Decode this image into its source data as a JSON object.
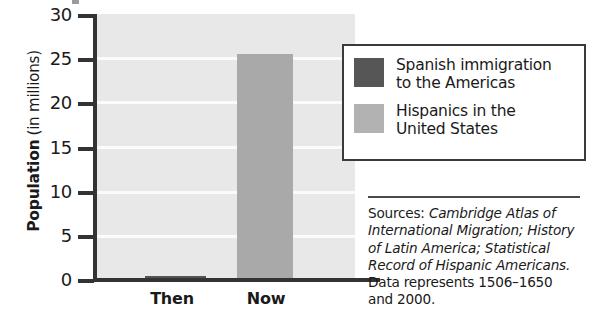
{
  "chart_data": {
    "type": "bar",
    "title": "",
    "xlabel": "",
    "ylabel": "Population (in millions)",
    "ylabel_bold_part": "Population",
    "ylabel_rest": "(in millions)",
    "categories": [
      "Then",
      "Now"
    ],
    "values": [
      0.6,
      25.5
    ],
    "series": [
      {
        "name": "Spanish immigration to the Americas",
        "values": [
          0.6,
          null
        ],
        "color": "#545454"
      },
      {
        "name": "Hispanics in the United States",
        "values": [
          null,
          25.5
        ],
        "color": "#a9a9a9"
      }
    ],
    "ylim": [
      0,
      30
    ],
    "yticks": [
      0,
      5,
      10,
      15,
      20,
      25,
      30
    ],
    "ytick_labels": [
      "0",
      "5",
      "10",
      "15",
      "20",
      "25",
      "30"
    ],
    "grid": true,
    "grid_color": "#fbfbfb",
    "plot_background": "#e8e8e8",
    "legend_position": "right",
    "legend": [
      {
        "label": "Spanish immigration\nto the Americas",
        "color": "#565656"
      },
      {
        "label": "Hispanics in the\nUnited States",
        "color": "#b2b2b2"
      }
    ],
    "annotations": {
      "sources_label": "Sources:",
      "sources_titles": [
        "Cambridge Atlas of",
        "International Migration; History",
        "of Latin America; Statistical",
        "Record of Hispanic Americans."
      ],
      "data_note": [
        "Data represents 1506–1650",
        "and 2000."
      ]
    }
  },
  "axis": {
    "y_title_strong": "Population",
    "y_title_rest": "(in millions)",
    "ticks": [
      {
        "value": "30",
        "top": 16
      },
      {
        "value": "25",
        "top": 60
      },
      {
        "value": "20",
        "top": 104
      },
      {
        "value": "15",
        "top": 148
      },
      {
        "value": "10",
        "top": 193
      },
      {
        "value": "5",
        "top": 237
      },
      {
        "value": "0",
        "top": 281
      }
    ]
  },
  "categories": {
    "then": "Then",
    "now": "Now"
  },
  "legend": {
    "items": [
      {
        "label": "Spanish immigration\nto the Americas"
      },
      {
        "label": "Hispanics in the\nUnited States"
      }
    ]
  },
  "sources": {
    "label": "Sources:",
    "line1_italic": "Cambridge Atlas of",
    "line2_italic": "International Migration; History",
    "line3_italic": "of Latin America; Statistical",
    "line4_italic": "Record of Hispanic Americans.",
    "line5": "Data represents 1506–1650",
    "line6": "and 2000."
  }
}
